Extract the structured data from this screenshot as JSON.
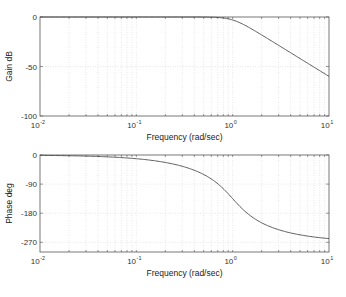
{
  "chart_data": [
    {
      "type": "line",
      "title": "",
      "xlabel": "Frequency (rad/sec)",
      "ylabel": "Gain dB",
      "xscale": "log",
      "xlim": [
        0.01,
        10
      ],
      "ylim": [
        -100,
        0
      ],
      "yticks": [
        0,
        -50,
        -100
      ],
      "xticks": [
        0.01,
        0.1,
        1,
        10
      ],
      "xtick_labels": [
        "10^-2",
        "10^-1",
        "10^0",
        "10^1"
      ],
      "grid": true,
      "series": [
        {
          "name": "gain",
          "x": [
            0.01,
            0.03,
            0.1,
            0.3,
            0.5,
            0.7,
            1.0,
            1.5,
            2.0,
            3.0,
            5.0,
            7.0,
            10.0
          ],
          "y": [
            0.0,
            0.0,
            0.0,
            0.0,
            -0.07,
            -0.47,
            -3.01,
            -10.8,
            -18.1,
            -28.6,
            -41.9,
            -50.7,
            -60.0
          ]
        }
      ]
    },
    {
      "type": "line",
      "title": "",
      "xlabel": "Frequency (rad/sec)",
      "ylabel": "Phase deg",
      "xscale": "log",
      "xlim": [
        0.01,
        10
      ],
      "ylim": [
        -300,
        0
      ],
      "yticks": [
        0,
        -90,
        -180,
        -270
      ],
      "xticks": [
        0.01,
        0.1,
        1,
        10
      ],
      "xtick_labels": [
        "10^-2",
        "10^-1",
        "10^0",
        "10^1"
      ],
      "grid": true,
      "series": [
        {
          "name": "phase",
          "x": [
            0.01,
            0.03,
            0.1,
            0.3,
            0.5,
            0.7,
            1.0,
            1.5,
            2.0,
            3.0,
            5.0,
            7.0,
            10.0
          ],
          "y": [
            -1.1,
            -3.4,
            -11.5,
            -35.4,
            -61.9,
            -92.6,
            -135.0,
            -184.6,
            -210.0,
            -233.1,
            -250.6,
            -256.6,
            -260.8
          ]
        }
      ]
    }
  ],
  "plots": {
    "gain": {
      "ylabel": "Gain dB",
      "xlabel": "Frequency (rad/sec)"
    },
    "phase": {
      "ylabel": "Phase deg",
      "xlabel": "Frequency (rad/sec)"
    }
  },
  "colors": {
    "curve": "#4a4a4a",
    "axis": "#555555",
    "grid": "#d8d8d8"
  }
}
